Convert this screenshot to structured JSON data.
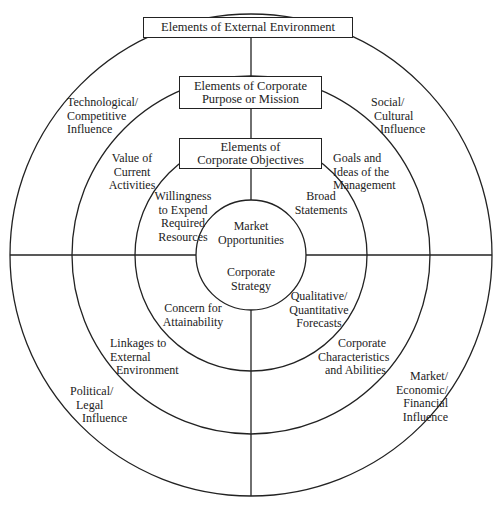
{
  "diagram": {
    "center_circle": {
      "top": "Market\nOpportunities",
      "bottom": "Corporate\nStrategy"
    },
    "boxes": {
      "external": "Elements of External Environment",
      "purpose": "Elements of Corporate\nPurpose or Mission",
      "objectives": "Elements of\nCorporate Objectives"
    },
    "outer_ring": {
      "top_left": "Technological/\nCompetitive\nInfluence",
      "top_right": "Social/\n Cultural\n   Influence",
      "bottom_left": "Political/\n  Legal\n    Influence",
      "bottom_right": "Market/\nEconomic/\nFinancial\nInfluence"
    },
    "middle_ring": {
      "top_left": "Value of\nCurrent\nActivities",
      "top_right": "Goals and\nIdeas of the\nManagement",
      "bottom_left": "Linkages to\nExternal\n  Environment",
      "bottom_right": "Corporate\nCharacteristics\nand Abilities"
    },
    "inner_ring": {
      "top_left": "Willingness\nto Expend\nRequired\nResources",
      "top_right": "Broad\nStatements",
      "bottom_left": "Concern for\nAttainability",
      "bottom_right": "Qualitative/\nQuantitative\nForecasts"
    },
    "colors": {
      "line": "#222222",
      "background": "#ffffff"
    }
  }
}
